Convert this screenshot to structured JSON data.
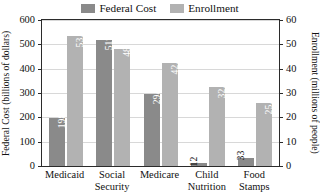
{
  "legend": {
    "entries": [
      {
        "label": "Federal Cost",
        "color": "#8a8a8a",
        "icon": "legend-swatch-icon"
      },
      {
        "label": "Enrollment",
        "color": "#b2b2b2",
        "icon": "legend-swatch-icon"
      }
    ]
  },
  "axes": {
    "y_left_title": "Federal Cost (billions of dollars)",
    "y_right_title": "Enrollment (millions of people)",
    "y_left_ticks": [
      "0",
      "100",
      "200",
      "300",
      "400",
      "500",
      "600"
    ],
    "y_right_ticks": [
      "0",
      "10",
      "20",
      "30",
      "40",
      "50",
      "60"
    ]
  },
  "chart_data": {
    "type": "bar",
    "title": "",
    "xlabel": "",
    "ylabel": "Federal Cost (billions of dollars)",
    "y2label": "Enrollment (millions of people)",
    "ylim": [
      0,
      600
    ],
    "y2lim": [
      0,
      60
    ],
    "yticks": [
      0,
      100,
      200,
      300,
      400,
      500,
      600
    ],
    "y2ticks": [
      0,
      10,
      20,
      30,
      40,
      50,
      60
    ],
    "grid": true,
    "legend_position": "top-center",
    "categories": [
      "Medicaid",
      "Social Security",
      "Medicare",
      "Child Nutrition",
      "Food Stamps"
    ],
    "category_lines": [
      [
        "Medicaid"
      ],
      [
        "Social",
        "Security"
      ],
      [
        "Medicare"
      ],
      [
        "Child",
        "Nutrition"
      ],
      [
        "Food",
        "Stamps"
      ]
    ],
    "series": [
      {
        "name": "Federal Cost",
        "axis": "left",
        "color": "#8a8a8a",
        "values": [
          198,
          519,
          294,
          12,
          33
        ],
        "labels": [
          "198",
          "519",
          "294",
          "12",
          "33"
        ]
      },
      {
        "name": "Enrollment",
        "axis": "right",
        "color": "#b2b2b2",
        "values": [
          53.4,
          48,
          42.3,
          32.3,
          25.7
        ],
        "labels": [
          "53.4",
          "48",
          "42.3",
          "32.3",
          "25.7"
        ]
      }
    ]
  }
}
